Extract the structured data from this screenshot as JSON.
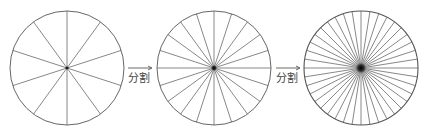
{
  "diagram": {
    "colors": {
      "background": "#ffffff",
      "stroke": "#6a6a6a",
      "outline": "#555555",
      "center": "#111111",
      "arrow": "#444444"
    },
    "circles": [
      {
        "id": "circle-10",
        "cx": 67,
        "cy": 68,
        "r": 57,
        "sectors": 10,
        "start_angle_deg": 90
      },
      {
        "id": "circle-20",
        "cx": 214,
        "cy": 68,
        "r": 57,
        "sectors": 20,
        "start_angle_deg": 90
      },
      {
        "id": "circle-40",
        "cx": 361,
        "cy": 68,
        "r": 57,
        "sectors": 40,
        "start_angle_deg": 90
      }
    ],
    "arrows": [
      {
        "x1": 128,
        "x2": 152,
        "y": 68,
        "label": "分割",
        "label_x": 128,
        "label_y": 73
      },
      {
        "x1": 276,
        "x2": 300,
        "y": 68,
        "label": "分割",
        "label_x": 276,
        "label_y": 73
      }
    ]
  }
}
